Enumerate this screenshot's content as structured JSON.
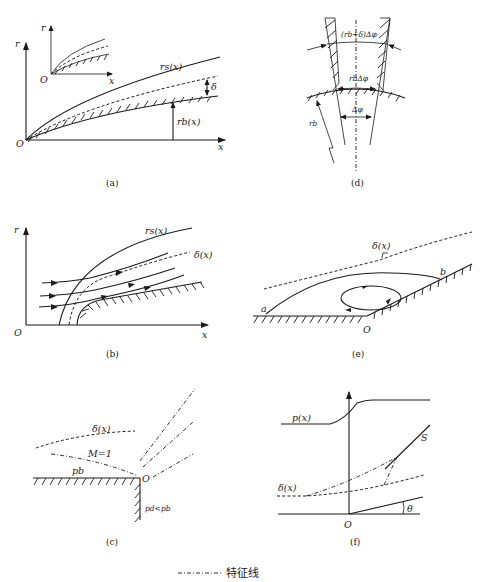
{
  "figure": {
    "panels": {
      "a": {
        "caption": "(a)",
        "labels": {
          "r_axis": "r",
          "x_axis": "x",
          "origin": "O",
          "shock": "rs(x)",
          "body": "rb(x)",
          "delta": "δ"
        },
        "inset": {
          "r_axis": "r",
          "x_axis": "x",
          "origin": "O"
        }
      },
      "b": {
        "caption": "(b)",
        "labels": {
          "r_axis": "r",
          "x_axis": "x",
          "origin": "O",
          "shock": "rs(x)",
          "delta": "δ(x)"
        }
      },
      "c": {
        "caption": "(c)",
        "labels": {
          "delta": "δ(x)",
          "mach": "M=1",
          "pb": "pb",
          "origin": "O",
          "pressure_relation": "pd<pb"
        }
      },
      "d": {
        "caption": "(d)",
        "labels": {
          "outer_arc": "(rb+δ)Δφ",
          "inner_arc": "rbΔφ",
          "angle": "Δφ",
          "radius": "rb"
        }
      },
      "e": {
        "caption": "(e)",
        "labels": {
          "delta": "δ(x)",
          "point_a": "a",
          "point_b": "b",
          "origin": "O"
        }
      },
      "f": {
        "caption": "(f)",
        "labels": {
          "pressure": "p(x)",
          "shock": "S",
          "delta": "δ(x)",
          "origin": "O",
          "angle": "θ"
        }
      }
    },
    "legend": {
      "line_style": "dash-dot",
      "label": "特征线"
    }
  }
}
